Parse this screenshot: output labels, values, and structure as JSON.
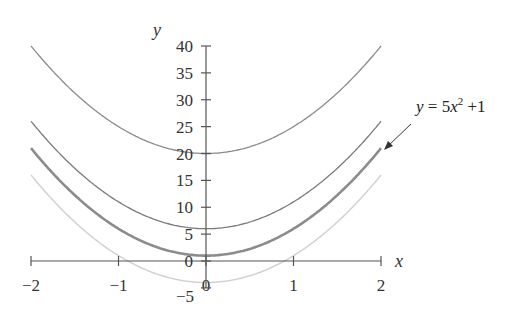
{
  "chart_data": {
    "type": "line",
    "title": "",
    "xlabel": "x",
    "ylabel": "y",
    "xlim": [
      -2,
      2
    ],
    "ylim": [
      -5,
      40
    ],
    "grid": false,
    "x_ticks": [
      "-2",
      "-1",
      "0",
      "1",
      "2"
    ],
    "y_ticks": [
      "-5",
      "0",
      "5",
      "10",
      "15",
      "20",
      "25",
      "30",
      "35",
      "40"
    ],
    "series": [
      {
        "name": "y = 5x^2 + 20",
        "formula": "5x^2+20",
        "style": "thin gray",
        "x": [
          -2,
          -1,
          0,
          1,
          2
        ],
        "values": [
          40,
          25,
          20,
          25,
          40
        ]
      },
      {
        "name": "y = 5x^2 + 6",
        "formula": "5x^2+6",
        "style": "thin gray",
        "x": [
          -2,
          -1,
          0,
          1,
          2
        ],
        "values": [
          26,
          11,
          6,
          11,
          26
        ]
      },
      {
        "name": "y = 5x^2 + 1",
        "formula": "5x^2+1",
        "style": "thick gray (highlighted)",
        "x": [
          -2,
          -1,
          0,
          1,
          2
        ],
        "values": [
          21,
          6,
          1,
          6,
          21
        ]
      },
      {
        "name": "y = 5x^2 - 4",
        "formula": "5x^2-4",
        "style": "light gray",
        "x": [
          -2,
          -1,
          0,
          1,
          2
        ],
        "values": [
          16,
          1,
          -4,
          1,
          16
        ]
      }
    ],
    "annotations": [
      {
        "text": "y = 5x² +1",
        "points_to": "y = 5x^2 + 1",
        "arrow": true
      }
    ]
  },
  "labels": {
    "x_axis": "x",
    "y_axis": "y",
    "annotation_y": "y",
    "annotation_eq": " = 5",
    "annotation_x": "x",
    "annotation_exp": "2",
    "annotation_tail": " +1"
  }
}
